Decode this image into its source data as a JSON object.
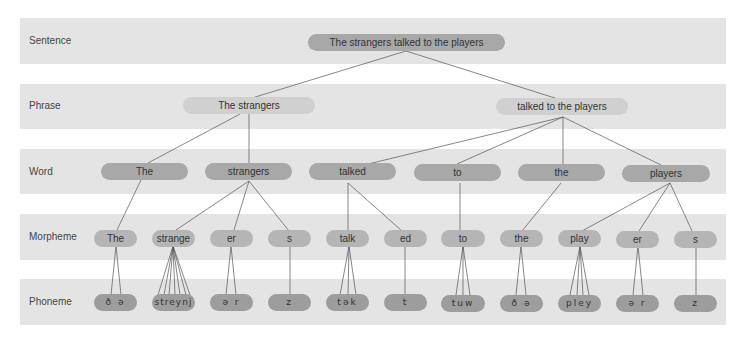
{
  "levels": [
    {
      "label": "Sentence"
    },
    {
      "label": "Phrase"
    },
    {
      "label": "Word"
    },
    {
      "label": "Morpheme"
    },
    {
      "label": "Phoneme"
    }
  ],
  "sentence": {
    "text": "The strangers talked to the players"
  },
  "phrases": [
    {
      "text": "The strangers"
    },
    {
      "text": "talked to the players"
    }
  ],
  "words": [
    {
      "text": "The"
    },
    {
      "text": "strangers"
    },
    {
      "text": "talked"
    },
    {
      "text": "to"
    },
    {
      "text": "the"
    },
    {
      "text": "players"
    }
  ],
  "morphemes": [
    {
      "text": "The"
    },
    {
      "text": "strange"
    },
    {
      "text": "er"
    },
    {
      "text": "s"
    },
    {
      "text": "talk"
    },
    {
      "text": "ed"
    },
    {
      "text": "to"
    },
    {
      "text": "the"
    },
    {
      "text": "play"
    },
    {
      "text": "er"
    },
    {
      "text": "s"
    }
  ],
  "phonemes": [
    {
      "text": "ð ə"
    },
    {
      "text": "streynj"
    },
    {
      "text": "ə r"
    },
    {
      "text": "z"
    },
    {
      "text": "tək"
    },
    {
      "text": "t"
    },
    {
      "text": "tuw"
    },
    {
      "text": "ð ə"
    },
    {
      "text": "pley"
    },
    {
      "text": "ə r"
    },
    {
      "text": "z"
    }
  ],
  "colors": {
    "band": "#e4e4e4",
    "node": "#a8a8a8",
    "phrase_node": "#d0d0d0",
    "line": "#555555"
  }
}
